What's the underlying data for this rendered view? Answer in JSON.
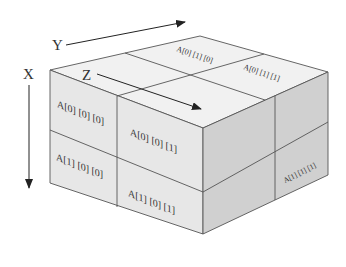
{
  "diagram": {
    "title": "",
    "axes": {
      "x": {
        "label": "X"
      },
      "y": {
        "label": "Y"
      },
      "z": {
        "label": "Z"
      }
    },
    "cells": {
      "front": [
        {
          "label": "A[0] [0] [0]"
        },
        {
          "label": "A[0] [0] [1]"
        },
        {
          "label": "A[1] [0] [0]"
        },
        {
          "label": "A[1] [0] [1]"
        }
      ],
      "top": [
        {
          "label": "A[0] [1] [0]"
        },
        {
          "label": "A[0] [1] [1]"
        }
      ],
      "right": [
        {
          "label": "A[1] [1] [1]"
        }
      ]
    },
    "colors": {
      "top_face": "#f0f0f0",
      "front_face": "#e6e6e6",
      "right_face": "#cfcfcf",
      "edge": "#555555",
      "arrow": "#222222"
    }
  }
}
